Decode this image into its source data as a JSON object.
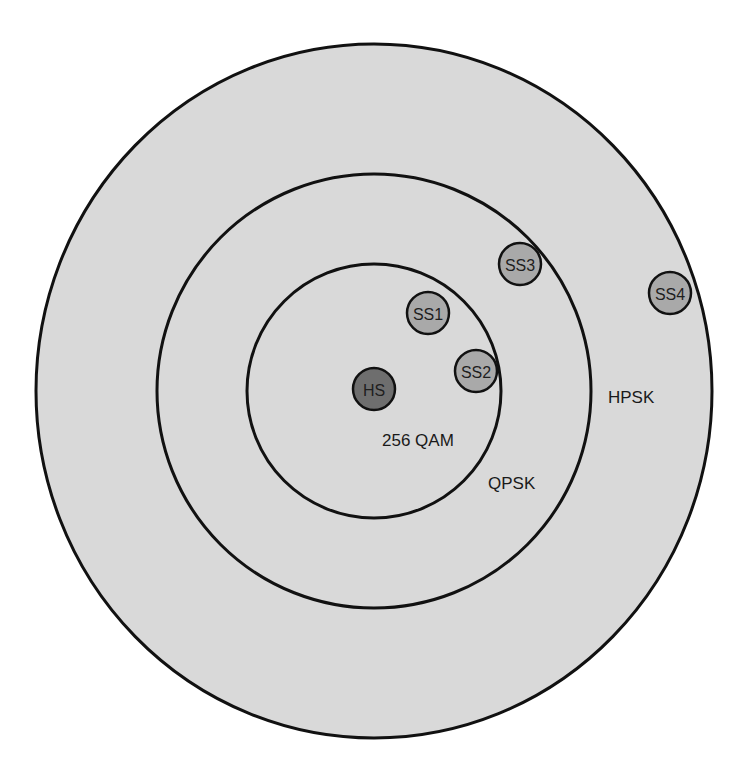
{
  "diagram": {
    "type": "concentric-coverage",
    "colors": {
      "background": "#ffffff",
      "zone_fill": "#d9d9d9",
      "ring_stroke": "#111111",
      "hub_fill": "#6e6e6e",
      "station_fill": "#a9a9a9"
    },
    "rings": [
      {
        "id": "outer",
        "label": "HPSK",
        "cx": 374,
        "cy": 391,
        "rx": 338,
        "ry": 347,
        "label_x": 608,
        "label_y": 403
      },
      {
        "id": "middle",
        "label": "QPSK",
        "cx": 374,
        "cy": 391,
        "rx": 217,
        "ry": 217,
        "label_x": 488,
        "label_y": 489
      },
      {
        "id": "inner",
        "label": "256 QAM",
        "cx": 374,
        "cy": 391,
        "rx": 127,
        "ry": 127,
        "label_x": 382,
        "label_y": 446
      }
    ],
    "nodes": [
      {
        "id": "HS",
        "label": "HS",
        "role": "hub",
        "cx": 374,
        "cy": 389,
        "r": 21
      },
      {
        "id": "SS1",
        "label": "SS1",
        "role": "station",
        "cx": 428,
        "cy": 313,
        "r": 21
      },
      {
        "id": "SS2",
        "label": "SS2",
        "role": "station",
        "cx": 476,
        "cy": 371,
        "r": 21
      },
      {
        "id": "SS3",
        "label": "SS3",
        "role": "station",
        "cx": 520,
        "cy": 264,
        "r": 21
      },
      {
        "id": "SS4",
        "label": "SS4",
        "role": "station",
        "cx": 670,
        "cy": 293,
        "r": 21
      }
    ]
  }
}
